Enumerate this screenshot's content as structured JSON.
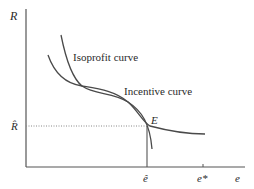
{
  "diagram": {
    "axes": {
      "y_label": "R",
      "x_label": "e",
      "y_tick_label": "R̂",
      "x_tick_labels": [
        "ê",
        "e*"
      ]
    },
    "curves": [
      {
        "name": "Isoprofit curve",
        "label": "Isoprofit curve"
      },
      {
        "name": "Incentive curve",
        "label": "Incentive curve"
      }
    ],
    "points": [
      {
        "name": "E",
        "label": "E"
      }
    ],
    "colors": {
      "axis": "#555555",
      "curve": "#4a4a4a",
      "dotted": "#888888",
      "text": "#2a2a2a"
    }
  }
}
